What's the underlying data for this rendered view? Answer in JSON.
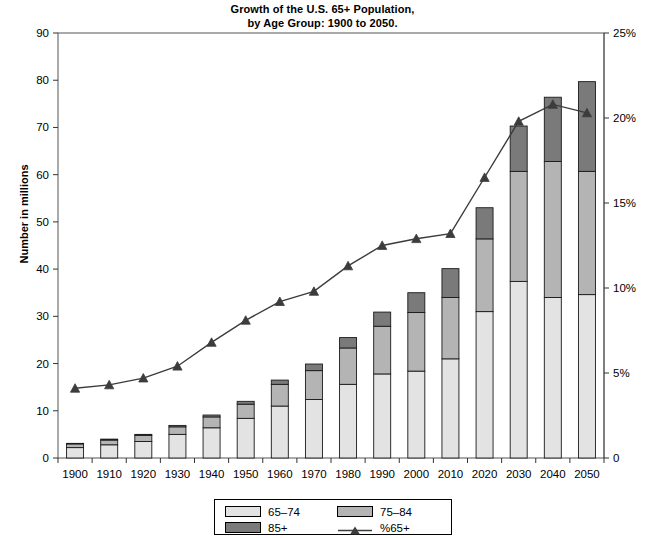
{
  "chart_data": {
    "type": "bar",
    "title": "Growth of the U.S. 65+ Population, by Age Group: 1900 to 2050.",
    "title_line1": "Growth of the U.S. 65+ Population,",
    "title_line2": "by Age Group: 1900 to 2050.",
    "xlabel": "",
    "ylabel": "Number in millions",
    "ylabel_right": "",
    "categories": [
      "1900",
      "1910",
      "1920",
      "1930",
      "1940",
      "1950",
      "1960",
      "1970",
      "1980",
      "1990",
      "2000",
      "2010",
      "2020",
      "2030",
      "2040",
      "2050"
    ],
    "ylim": [
      0,
      90
    ],
    "yticks": [
      0,
      10,
      20,
      30,
      40,
      50,
      60,
      70,
      80,
      90
    ],
    "ytick_labels": [
      "0",
      "10",
      "20",
      "30",
      "40",
      "50",
      "60",
      "70",
      "80",
      "90"
    ],
    "ylim_right": [
      0,
      25
    ],
    "yticks_right": [
      0,
      5,
      10,
      15,
      20,
      25
    ],
    "ytick_labels_right": [
      "0",
      "5%",
      "10%",
      "15%",
      "20%",
      "25%"
    ],
    "grid": false,
    "legend_position": "bottom",
    "stacked": true,
    "series": [
      {
        "name": "65–74",
        "color": "#e3e3e3",
        "values": [
          2.2,
          2.8,
          3.5,
          5.0,
          6.4,
          8.4,
          11.0,
          12.4,
          15.6,
          17.8,
          18.4,
          21.0,
          31.0,
          37.4,
          34.0,
          34.6
        ]
      },
      {
        "name": "75–84",
        "color": "#b4b4b4",
        "values": [
          0.8,
          1.0,
          1.3,
          1.6,
          2.3,
          3.0,
          4.6,
          6.1,
          7.7,
          10.1,
          12.4,
          13.0,
          15.4,
          23.3,
          28.8,
          26.1
        ]
      },
      {
        "name": "85+",
        "color": "#7a7a7a",
        "values": [
          0.1,
          0.2,
          0.2,
          0.3,
          0.4,
          0.6,
          0.9,
          1.4,
          2.2,
          3.0,
          4.2,
          6.1,
          6.6,
          9.6,
          13.6,
          19.0
        ]
      }
    ],
    "line_series": {
      "name": "%65+",
      "axis": "right",
      "color": "#3c3c3c",
      "marker": "triangle",
      "values": [
        4.1,
        4.3,
        4.7,
        5.4,
        6.8,
        8.1,
        9.2,
        9.8,
        11.3,
        12.5,
        12.9,
        13.2,
        16.5,
        19.8,
        20.8,
        20.3
      ]
    }
  },
  "legend": {
    "items": [
      {
        "label": "65–74",
        "type": "swatch",
        "color": "#e3e3e3"
      },
      {
        "label": "75–84",
        "type": "swatch",
        "color": "#b4b4b4"
      },
      {
        "label": "85+",
        "type": "swatch",
        "color": "#7a7a7a"
      },
      {
        "label": "%65+",
        "type": "line-marker",
        "color": "#3c3c3c"
      }
    ]
  }
}
